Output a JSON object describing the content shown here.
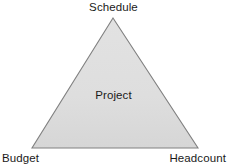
{
  "diagram": {
    "type": "triangle-diagram",
    "center_label": "Project",
    "vertices": [
      {
        "id": "apex",
        "label": "Schedule",
        "position": "top"
      },
      {
        "id": "bottom-left",
        "label": "Budget",
        "position": "bottom-left"
      },
      {
        "id": "bottom-right",
        "label": "Headcount",
        "position": "bottom-right"
      }
    ],
    "shape": {
      "apex_x": 113,
      "apex_y": 18,
      "base_left_x": 32,
      "base_right_x": 198,
      "base_y": 148
    },
    "colors": {
      "fill": "#dedede",
      "stroke": "#808080",
      "text": "#1a1a1a",
      "background": "#ffffff"
    }
  }
}
